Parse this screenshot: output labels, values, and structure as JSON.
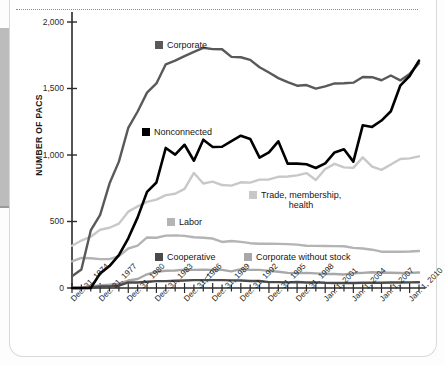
{
  "frame": {
    "edge_bar_color": "#bcbcbc",
    "card_background": "#ffffff",
    "rule_style": "dotted"
  },
  "chart_data": {
    "type": "line",
    "title": "",
    "subtitle": "",
    "xlabel": "",
    "ylabel": "NUMBER OF PACS",
    "ylim": [
      0,
      2000
    ],
    "yticks": [
      0,
      500,
      1000,
      1500,
      2000
    ],
    "ytick_labels": [
      "0",
      "500",
      "1,000",
      "1,500",
      "2,000"
    ],
    "grid": false,
    "legend_position": "inline-annotations",
    "x": [
      1974,
      1975,
      1976,
      1977,
      1978,
      1979,
      1980,
      1981,
      1982,
      1983,
      1984,
      1985,
      1986,
      1987,
      1988,
      1989,
      1990,
      1991,
      1992,
      1993,
      1994,
      1995,
      1996,
      1997,
      1998,
      1999,
      2000,
      2001,
      2002,
      2003,
      2004,
      2005,
      2006,
      2007,
      2008,
      2009,
      2010,
      2011
    ],
    "xtick_labels": [
      "Dec. 31, 1974",
      "Dec. 31, 1977",
      "Dec. 31, 1980",
      "Dec. 31, 1983",
      "Dec. 31, 1986",
      "Dec. 31, 1989",
      "Dec. 31, 1992",
      "Dec. 31, 1995",
      "Dec. 31, 1998",
      "Jan. 1, 2001",
      "Jan. 1, 2004",
      "Jan. 1, 2007",
      "Jan. 1, 2010"
    ],
    "xtick_label_years": [
      1974,
      1977,
      1980,
      1983,
      1986,
      1989,
      1992,
      1995,
      1998,
      2001,
      2004,
      2007,
      2010
    ],
    "series": [
      {
        "name": "Corporate",
        "color": "#595959",
        "label_lines": [
          "Corporate"
        ],
        "values": [
          89,
          139,
          433,
          550,
          785,
          950,
          1204,
          1327,
          1469,
          1538,
          1682,
          1710,
          1744,
          1775,
          1806,
          1796,
          1795,
          1738,
          1735,
          1715,
          1660,
          1620,
          1578,
          1548,
          1521,
          1526,
          1499,
          1516,
          1538,
          1539,
          1544,
          1587,
          1585,
          1562,
          1598,
          1561,
          1610,
          1690
        ]
      },
      {
        "name": "Nonconnected",
        "color": "#000000",
        "label_lines": [
          "Nonconnected"
        ],
        "values": [
          0,
          0,
          0,
          110,
          165,
          247,
          374,
          531,
          723,
          793,
          1053,
          1003,
          1077,
          957,
          1115,
          1060,
          1062,
          1105,
          1145,
          1121,
          980,
          1020,
          1103,
          935,
          935,
          930,
          902,
          937,
          1019,
          1043,
          950,
          1223,
          1211,
          1259,
          1329,
          1521,
          1594,
          1710
        ]
      },
      {
        "name": "Trade, membership, health",
        "color": "#c8c8c8",
        "label_lines": [
          "Trade, membership,",
          "health"
        ],
        "values": [
          318,
          357,
          386,
          438,
          453,
          484,
          574,
          614,
          648,
          664,
          698,
          709,
          745,
          865,
          786,
          800,
          774,
          770,
          795,
          792,
          815,
          816,
          836,
          838,
          847,
          864,
          812,
          895,
          933,
          907,
          903,
          982,
          912,
          888,
          929,
          970,
          975,
          990
        ]
      },
      {
        "name": "Labor",
        "color": "#b4b4b4",
        "label_lines": [
          "Labor"
        ],
        "values": [
          201,
          226,
          224,
          217,
          217,
          240,
          297,
          318,
          380,
          378,
          394,
          396,
          392,
          382,
          378,
          372,
          346,
          353,
          347,
          337,
          333,
          334,
          332,
          330,
          326,
          318,
          317,
          316,
          315,
          314,
          302,
          297,
          288,
          273,
          272,
          272,
          274,
          278
        ]
      },
      {
        "name": "Cooperative",
        "color": "#4a4a4a",
        "label_lines": [
          "Cooperative"
        ],
        "values": [
          0,
          0,
          2,
          12,
          12,
          17,
          42,
          41,
          47,
          52,
          52,
          54,
          56,
          59,
          59,
          59,
          59,
          57,
          56,
          53,
          53,
          44,
          44,
          42,
          45,
          41,
          42,
          39,
          38,
          38,
          38,
          40,
          39,
          39,
          41,
          41,
          42,
          43
        ]
      },
      {
        "name": "Corporate without stock",
        "color": "#a8a8a8",
        "label_lines": [
          "Corporate without stock"
        ],
        "values": [
          0,
          0,
          14,
          20,
          24,
          32,
          56,
          68,
          103,
          122,
          130,
          132,
          138,
          136,
          138,
          136,
          136,
          125,
          142,
          136,
          136,
          129,
          122,
          114,
          112,
          114,
          110,
          105,
          105,
          102,
          111,
          114,
          118,
          115,
          115,
          113,
          114,
          116
        ]
      }
    ],
    "annotations": [
      {
        "text": "Corporate",
        "series": "Corporate"
      },
      {
        "text": "Nonconnected",
        "series": "Nonconnected"
      },
      {
        "text": "Trade, membership, health",
        "series": "Trade, membership, health"
      },
      {
        "text": "Labor",
        "series": "Labor"
      },
      {
        "text": "Cooperative",
        "series": "Cooperative",
        "has_leader_line": true
      },
      {
        "text": "Corporate without stock",
        "series": "Corporate without stock"
      }
    ]
  }
}
